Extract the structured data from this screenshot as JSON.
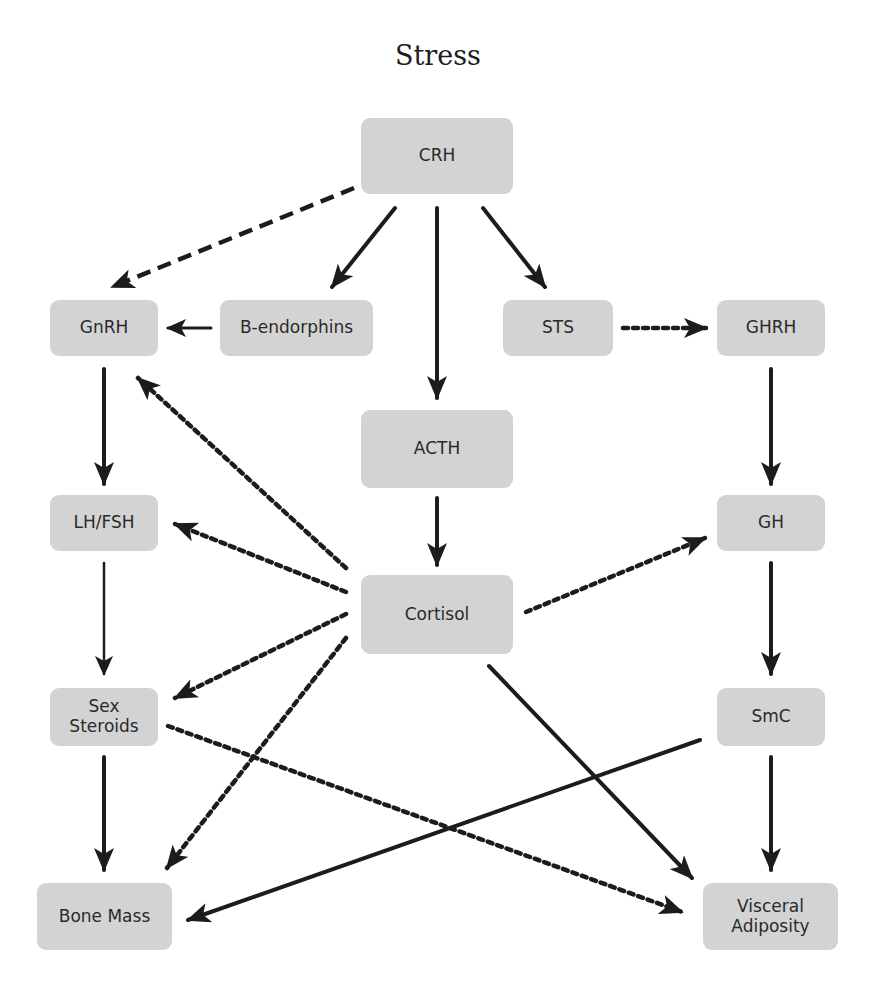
{
  "title": "Stress",
  "nodes": {
    "crh": "CRH",
    "gnrh": "GnRH",
    "b_endorphins": "B-endorphins",
    "sts": "STS",
    "ghrh": "GHRH",
    "acth": "ACTH",
    "lh_fsh": "LH/FSH",
    "gh": "GH",
    "cortisol": "Cortisol",
    "sex_steroids": "Sex\nSteroids",
    "smc": "SmC",
    "bone_mass": "Bone Mass",
    "visceral_adiposity": "Visceral\nAdiposity"
  },
  "edges": [
    {
      "from": "CRH",
      "to": "GnRH",
      "style": "dashed"
    },
    {
      "from": "CRH",
      "to": "B-endorphins",
      "style": "solid"
    },
    {
      "from": "CRH",
      "to": "ACTH",
      "style": "solid"
    },
    {
      "from": "CRH",
      "to": "STS",
      "style": "solid"
    },
    {
      "from": "B-endorphins",
      "to": "GnRH",
      "style": "solid"
    },
    {
      "from": "STS",
      "to": "GHRH",
      "style": "dotted"
    },
    {
      "from": "GnRH",
      "to": "LH/FSH",
      "style": "solid"
    },
    {
      "from": "GHRH",
      "to": "GH",
      "style": "solid"
    },
    {
      "from": "ACTH",
      "to": "Cortisol",
      "style": "solid"
    },
    {
      "from": "Cortisol",
      "to": "GnRH",
      "style": "dotted"
    },
    {
      "from": "Cortisol",
      "to": "LH/FSH",
      "style": "dotted"
    },
    {
      "from": "Cortisol",
      "to": "GH",
      "style": "dotted"
    },
    {
      "from": "Cortisol",
      "to": "Sex Steroids",
      "style": "dotted"
    },
    {
      "from": "Cortisol",
      "to": "Bone Mass",
      "style": "dotted"
    },
    {
      "from": "Cortisol",
      "to": "Visceral Adiposity",
      "style": "solid"
    },
    {
      "from": "LH/FSH",
      "to": "Sex Steroids",
      "style": "solid-thin"
    },
    {
      "from": "GH",
      "to": "SmC",
      "style": "solid"
    },
    {
      "from": "Sex Steroids",
      "to": "Bone Mass",
      "style": "solid"
    },
    {
      "from": "Sex Steroids",
      "to": "Visceral Adiposity",
      "style": "dotted"
    },
    {
      "from": "SmC",
      "to": "Bone Mass",
      "style": "solid"
    },
    {
      "from": "SmC",
      "to": "Visceral Adiposity",
      "style": "solid"
    }
  ]
}
